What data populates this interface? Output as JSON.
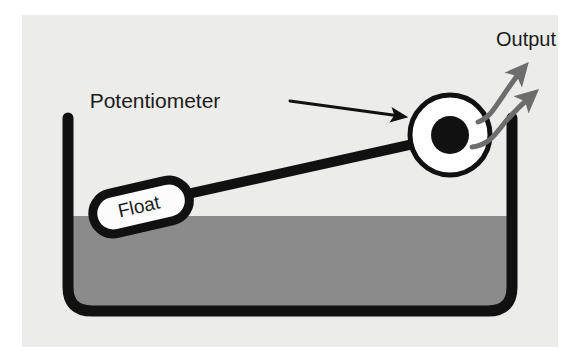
{
  "diagram": {
    "title_hint": "float-type liquid level sensor",
    "background_color": "#ececeb",
    "page_background": "#ffffff",
    "labels": {
      "potentiometer": "Potentiometer",
      "output": "Output",
      "float": "Float"
    },
    "colors": {
      "stroke": "#111111",
      "liquid": "#8b8b8b",
      "tank_air": "#ececeb",
      "float_fill": "#fcfcfc",
      "arrow_gray": "#6d6d6d",
      "pot_ring_fill": "#ffffff",
      "pot_hub_fill": "#111111"
    },
    "parts": {
      "tank": "tank-vessel",
      "liquid": "liquid-fill",
      "liquid_surface": "liquid-surface-line",
      "float": "float-body",
      "arm": "float-arm-rod",
      "potentiometer_ring": "potentiometer-ring",
      "potentiometer_hub": "potentiometer-hub",
      "output_arrow_upper": "output-arrow-upper",
      "output_arrow_lower": "output-arrow-lower",
      "pointer": "potentiometer-pointer-arrow"
    },
    "geometry": {
      "liquid_level_y": 201,
      "tank_left_x": 46,
      "tank_right_x": 490,
      "tank_top_y": 103,
      "tank_bottom_y": 297,
      "pot_center_x": 428,
      "pot_center_y": 120,
      "pot_outer_radius": 41,
      "pot_hub_radius": 19
    }
  }
}
